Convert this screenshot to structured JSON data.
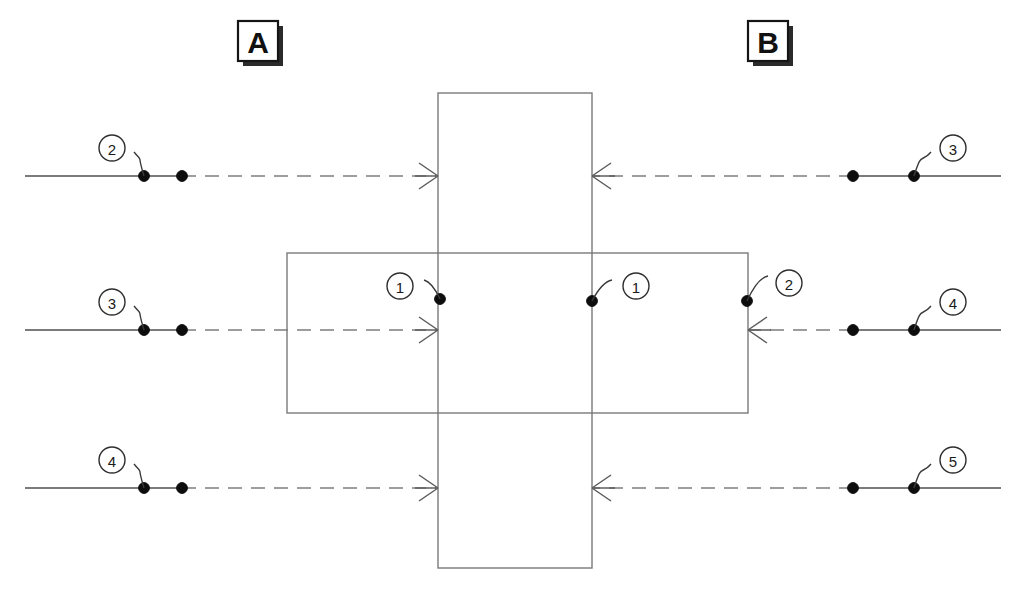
{
  "diagram": {
    "canvas": {
      "width": 1026,
      "height": 590
    },
    "zone_labels": [
      {
        "id": "zone-a",
        "text": "A",
        "x": 258,
        "y": 41
      },
      {
        "id": "zone-b",
        "text": "B",
        "x": 768,
        "y": 41
      }
    ],
    "parts": [
      {
        "id": "vertical-part",
        "x": 438,
        "y": 93,
        "width": 154,
        "height": 475
      },
      {
        "id": "horizontal-part",
        "x": 287,
        "y": 253,
        "width": 461,
        "height": 160
      }
    ],
    "rows": [
      {
        "id": "row-top",
        "y": 176,
        "left": {
          "solid_from": 25,
          "solid_to": 182,
          "dashed_to": 438,
          "dots": [
            144,
            182
          ],
          "balloon": {
            "label": "2",
            "cx": 112,
            "cy": 148,
            "r": 13,
            "anchor_x": 144,
            "anchor_y": 176
          }
        },
        "right": {
          "solid_from": 1001,
          "solid_to": 853,
          "dashed_to": 592,
          "dots": [
            853,
            914
          ],
          "balloon": {
            "label": "3",
            "cx": 953,
            "cy": 148,
            "r": 13,
            "anchor_x": 914,
            "anchor_y": 176
          }
        }
      },
      {
        "id": "row-middle",
        "y": 330,
        "left": {
          "solid_from": 25,
          "solid_to": 182,
          "dashed_to": 438,
          "dots": [
            144,
            182
          ],
          "balloon": {
            "label": "3",
            "cx": 112,
            "cy": 302,
            "r": 13,
            "anchor_x": 144,
            "anchor_y": 330
          }
        },
        "right": {
          "solid_from": 1001,
          "solid_to": 853,
          "dashed_to": 748,
          "dots": [
            853,
            914
          ],
          "balloon": {
            "label": "4",
            "cx": 953,
            "cy": 302,
            "r": 13,
            "anchor_x": 914,
            "anchor_y": 330
          }
        }
      },
      {
        "id": "row-bottom",
        "y": 488,
        "left": {
          "solid_from": 25,
          "solid_to": 182,
          "dashed_to": 438,
          "dots": [
            144,
            182
          ],
          "balloon": {
            "label": "4",
            "cx": 112,
            "cy": 460,
            "r": 13,
            "anchor_x": 144,
            "anchor_y": 488
          }
        },
        "right": {
          "solid_from": 1001,
          "solid_to": 853,
          "dashed_to": 592,
          "dots": [
            853,
            914
          ],
          "balloon": {
            "label": "5",
            "cx": 953,
            "cy": 460,
            "r": 13,
            "anchor_x": 914,
            "anchor_y": 488
          }
        }
      }
    ],
    "arrows": [
      {
        "id": "arrow-top-left",
        "x": 438,
        "y": 176,
        "direction": "right"
      },
      {
        "id": "arrow-top-right",
        "x": 592,
        "y": 176,
        "direction": "left"
      },
      {
        "id": "arrow-middle-left",
        "x": 438,
        "y": 330,
        "direction": "right"
      },
      {
        "id": "arrow-middle-right",
        "x": 748,
        "y": 330,
        "direction": "left"
      },
      {
        "id": "arrow-bottom-left",
        "x": 438,
        "y": 488,
        "direction": "right"
      },
      {
        "id": "arrow-bottom-right",
        "x": 592,
        "y": 488,
        "direction": "left"
      }
    ],
    "interior_callouts": [
      {
        "id": "callout-inner-left",
        "label": "1",
        "cx": 400,
        "cy": 286,
        "r": 13,
        "anchor_x": 440,
        "anchor_y": 299,
        "bend_x": 424,
        "bend_y": 280
      },
      {
        "id": "callout-inner-right",
        "label": "1",
        "cx": 636,
        "cy": 286,
        "r": 13,
        "anchor_x": 592,
        "anchor_y": 301,
        "bend_x": 612,
        "bend_y": 280
      },
      {
        "id": "callout-edge-right",
        "label": "2",
        "cx": 789,
        "cy": 283,
        "r": 13,
        "anchor_x": 747,
        "anchor_y": 301,
        "bend_x": 768,
        "bend_y": 276
      }
    ],
    "colors": {
      "line": "#4f4f4f",
      "dashed": "#7e7e7e",
      "part_outline": "#7a7a7a",
      "dot": "#0d0d0d",
      "balloon_stroke": "#2e2e2e",
      "zone_stroke": "#151515"
    }
  }
}
